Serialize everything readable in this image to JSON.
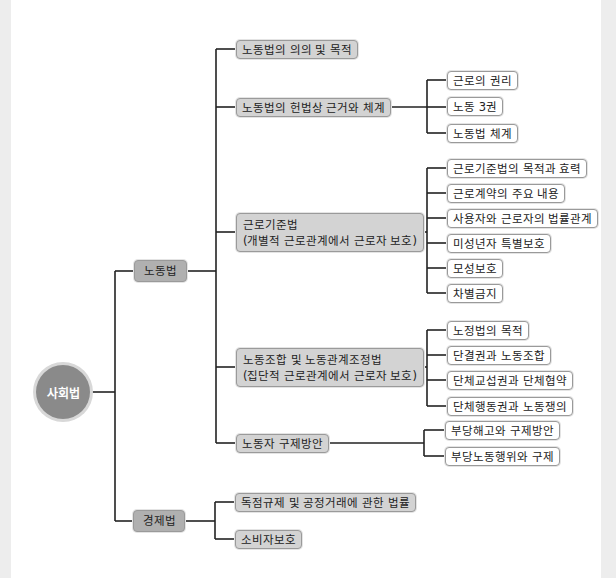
{
  "root": {
    "label": "사회법"
  },
  "categories": [
    {
      "label": "노동법",
      "children": [
        {
          "label": "노동법의 의의 및 목적",
          "children": []
        },
        {
          "label": "노동법의 헌법상 근거와 체계",
          "children": [
            "근로의 권리",
            "노동 3권",
            "노동법 체계"
          ]
        },
        {
          "label": "근로기준법\n(개별적 근로관계에서 근로자 보호)",
          "children": [
            "근로기준법의 목적과 효력",
            "근로계약의 주요 내용",
            "사용자와 근로자의 법률관계",
            "미성년자 특별보호",
            "모성보호",
            "차별금지"
          ]
        },
        {
          "label": "노동조합 및 노동관계조정법\n(집단적 근로관계에서 근로자 보호)",
          "children": [
            "노정법의 목적",
            "단결권과 노동조합",
            "단체교섭권과 단체협약",
            "단체행동권과 노동쟁의"
          ]
        },
        {
          "label": "노동자 구제방안",
          "children": [
            "부당해고와 구제방안",
            "부당노동행위와 구제"
          ]
        }
      ]
    },
    {
      "label": "경제법",
      "children": [
        {
          "label": "독점규제 및 공정거래에 관한 법률",
          "children": []
        },
        {
          "label": "소비자보호",
          "children": []
        }
      ]
    }
  ],
  "colors": {
    "line": "#222222",
    "node_fill": "#d3d3d3",
    "category_fill": "#b0b0b0",
    "root_fill": "#8a8a8a",
    "leaf_fill": "#ffffff",
    "border": "#9a9a9a"
  }
}
